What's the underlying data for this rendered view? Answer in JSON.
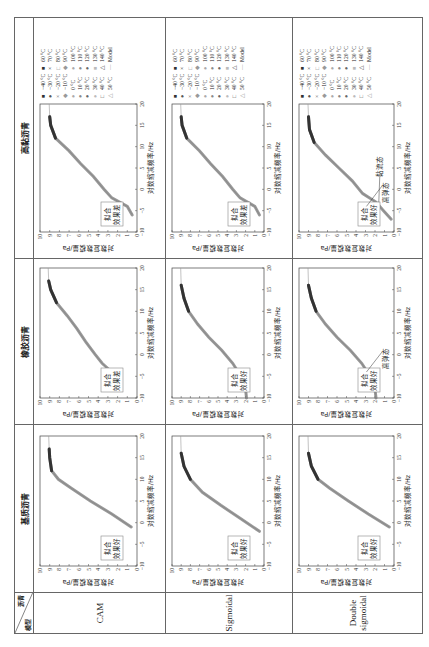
{
  "table": {
    "corner": {
      "top_right": "沥青",
      "bottom_left": "模型"
    },
    "columns": [
      "基质沥青",
      "橡胶沥青",
      "高黏沥青"
    ],
    "rows": [
      "CAM",
      "Sigmoidal",
      "Double sigmoidal"
    ]
  },
  "axes": {
    "ylabel": "对数复数模量/Pa",
    "xlabel": "对数缩减频率/Hz",
    "x_ticks": [
      "-10",
      "-5",
      "0",
      "5",
      "10",
      "15",
      "20"
    ],
    "y_ticks": [
      "0",
      "1",
      "2",
      "3",
      "4",
      "5",
      "6",
      "7",
      "8",
      "9",
      "10"
    ]
  },
  "cells": [
    [
      {
        "note": "拟合效果好"
      },
      {
        "note": "拟合效果差"
      },
      {
        "note": "拟合效果差"
      }
    ],
    [
      {
        "note": "拟合效果好"
      },
      {
        "note": "拟合效果好"
      },
      {
        "note": "拟合效果差"
      }
    ],
    [
      {
        "note": "拟合效果好"
      },
      {
        "note": "拟合效果好",
        "annotation": "高弹态"
      },
      {
        "note": "拟合效果好",
        "annotation": "高弹态",
        "annotation2": "黏流态"
      }
    ]
  ],
  "legend": {
    "col1": [
      "-40 °C",
      "-30 °C",
      "-20 °C",
      "-10 °C",
      "0 °C",
      "10 °C",
      "20 °C",
      "30 °C",
      "40 °C",
      "50 °C"
    ],
    "col2": [
      "60 °C",
      "70 °C",
      "80 °C",
      "90 °C",
      "100 °C",
      "110 °C",
      "120 °C",
      "130 °C",
      "140 °C",
      "Model"
    ],
    "markers1": [
      "■",
      "●",
      "×",
      "◆",
      "●",
      "●",
      "●",
      "●",
      "□",
      "△"
    ],
    "markers2": [
      "■",
      "×",
      "□",
      "◆",
      "●",
      "●",
      "●",
      "■",
      "△",
      "—"
    ]
  },
  "chart_data": {
    "type": "scatter",
    "xlabel": "对数缩减频率/Hz",
    "ylabel": "对数复数模量/Pa",
    "xlim": [
      -10,
      20
    ],
    "ylim": [
      0,
      10
    ],
    "panels": [
      {
        "row": "CAM",
        "col": "基质沥青",
        "fit": "拟合效果好",
        "x": [
          -1,
          2,
          5,
          8,
          10,
          12,
          15,
          17
        ],
        "y": [
          0.6,
          2.6,
          4.8,
          6.8,
          8.1,
          8.8,
          9.0,
          9.05
        ]
      },
      {
        "row": "CAM",
        "col": "橡胶沥青",
        "fit": "拟合效果差",
        "x": [
          -4,
          -2,
          0,
          3,
          6,
          9,
          12,
          15,
          17
        ],
        "y": [
          2.6,
          3.6,
          4.3,
          5.3,
          6.2,
          7.2,
          8.3,
          8.9,
          9.1
        ]
      },
      {
        "row": "CAM",
        "col": "高黏沥青",
        "fit": "拟合效果差",
        "x": [
          -6,
          -4,
          -2,
          0,
          3,
          6,
          9,
          12,
          15,
          17
        ],
        "y": [
          0.5,
          1.0,
          2.6,
          3.4,
          4.5,
          5.8,
          7.0,
          8.4,
          8.9,
          9.0
        ]
      },
      {
        "row": "Sigmoidal",
        "col": "基质沥青",
        "fit": "拟合效果好",
        "x": [
          -2,
          1,
          4,
          7,
          10,
          13,
          16
        ],
        "y": [
          0.5,
          2.6,
          4.7,
          6.7,
          8.0,
          8.7,
          9.0
        ]
      },
      {
        "row": "Sigmoidal",
        "col": "橡胶沥青",
        "fit": "拟合效果好",
        "x": [
          -10,
          -6,
          -4,
          -2,
          1,
          4,
          7,
          10,
          13,
          16
        ],
        "y": [
          1.9,
          2.1,
          2.8,
          3.4,
          4.6,
          6.0,
          7.2,
          8.2,
          8.7,
          9.0
        ]
      },
      {
        "row": "Sigmoidal",
        "col": "高黏沥青",
        "fit": "拟合效果差",
        "x": [
          -6,
          -4,
          -2,
          0,
          3,
          6,
          9,
          12,
          15,
          17
        ],
        "y": [
          0.5,
          1.0,
          2.6,
          3.4,
          4.5,
          5.8,
          7.0,
          8.4,
          8.9,
          9.0
        ]
      },
      {
        "row": "Double sigmoidal",
        "col": "基质沥青",
        "fit": "拟合效果好",
        "x": [
          -1,
          2,
          5,
          8,
          10,
          13,
          16
        ],
        "y": [
          0.5,
          2.7,
          4.8,
          6.8,
          8.0,
          8.7,
          9.0
        ]
      },
      {
        "row": "Double sigmoidal",
        "col": "橡胶沥青",
        "fit": "拟合效果好",
        "x": [
          -10,
          -6,
          -4,
          -2,
          1,
          4,
          7,
          10,
          13,
          16
        ],
        "y": [
          1.9,
          2.1,
          2.8,
          3.4,
          4.6,
          6.0,
          7.2,
          8.2,
          8.7,
          9.0
        ]
      },
      {
        "row": "Double sigmoidal",
        "col": "高黏沥青",
        "fit": "拟合效果好",
        "x": [
          -7,
          -5,
          -3,
          -1,
          2,
          5,
          8,
          11,
          14,
          17
        ],
        "y": [
          0.3,
          1.1,
          1.9,
          3.3,
          4.4,
          5.8,
          7.2,
          8.4,
          8.9,
          9.0
        ]
      }
    ]
  }
}
